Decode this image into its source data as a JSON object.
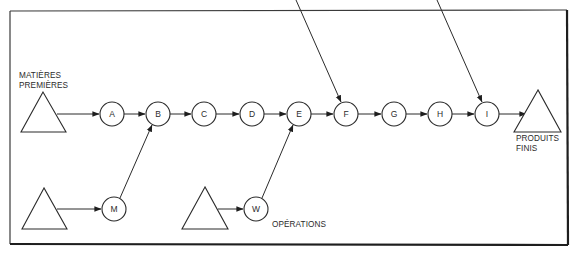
{
  "diagram": {
    "type": "process-flow",
    "colors": {
      "stroke": "#2b2b2b",
      "background": "#ffffff"
    },
    "labels": {
      "raw_materials_line1": "MATIÈRES",
      "raw_materials_line2": "PREMIÈRES",
      "finished_products_line1": "PRODUITS",
      "finished_products_line2": "FINIS",
      "operations": "OPÉRATIONS"
    },
    "stores": [
      {
        "id": "raw-materials",
        "shape": "triangle"
      },
      {
        "id": "supply-m",
        "shape": "triangle"
      },
      {
        "id": "supply-w",
        "shape": "triangle"
      },
      {
        "id": "finished-products",
        "shape": "triangle"
      }
    ],
    "nodes": {
      "A": "A",
      "B": "B",
      "C": "C",
      "D": "D",
      "E": "E",
      "F": "F",
      "G": "G",
      "H": "H",
      "I": "I",
      "M": "M",
      "W": "W"
    },
    "edges": [
      {
        "from": "raw-materials",
        "to": "A"
      },
      {
        "from": "A",
        "to": "B"
      },
      {
        "from": "B",
        "to": "C"
      },
      {
        "from": "C",
        "to": "D"
      },
      {
        "from": "D",
        "to": "E"
      },
      {
        "from": "E",
        "to": "F"
      },
      {
        "from": "F",
        "to": "G"
      },
      {
        "from": "G",
        "to": "H"
      },
      {
        "from": "H",
        "to": "I"
      },
      {
        "from": "I",
        "to": "finished-products"
      },
      {
        "from": "supply-m",
        "to": "M"
      },
      {
        "from": "M",
        "to": "B"
      },
      {
        "from": "supply-w",
        "to": "W"
      },
      {
        "from": "W",
        "to": "E"
      },
      {
        "from": "external-top-1",
        "to": "F"
      },
      {
        "from": "external-top-2",
        "to": "I"
      }
    ]
  }
}
